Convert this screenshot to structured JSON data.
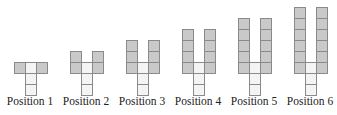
{
  "figures": [
    {
      "label": "Position 1",
      "n": 1,
      "cx": 30
    },
    {
      "label": "Position 2",
      "n": 2,
      "cx": 86
    },
    {
      "label": "Position 3",
      "n": 3,
      "cx": 142
    },
    {
      "label": "Position 4",
      "n": 4,
      "cx": 198
    },
    {
      "label": "Position 5",
      "n": 5,
      "cx": 254
    },
    {
      "label": "Position 6",
      "n": 6,
      "cx": 310
    }
  ],
  "colors": {
    "gray": "#c9c9c9",
    "white": "#f4f4f4",
    "border": "#8a8a8a"
  }
}
